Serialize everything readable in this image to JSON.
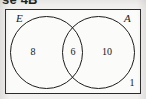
{
  "figure": {
    "header_clipped_text": "se 4B",
    "universal_set_label": "",
    "sets": [
      {
        "name": "E",
        "label": "E",
        "position": "left"
      },
      {
        "name": "A",
        "label": "A",
        "position": "right"
      }
    ],
    "regions": [
      {
        "name": "e-only",
        "label": "8",
        "description": "in E only"
      },
      {
        "name": "both",
        "label": "6",
        "description": "in E and A"
      },
      {
        "name": "a-only",
        "label": "10",
        "description": "in A only"
      },
      {
        "name": "outside",
        "label": "1",
        "description": "outside both sets"
      }
    ],
    "colors": {
      "stroke": "#1c1c1c",
      "rect_stroke": "#2b2b2b",
      "text": "#161616",
      "background": "#f2f1ef",
      "rect_fill": "#fbfbfa"
    }
  },
  "chart_data": {
    "type": "venn",
    "title": "",
    "set_labels": [
      "E",
      "A"
    ],
    "regions": {
      "E_only": 8,
      "intersection": 6,
      "A_only": 10,
      "outside": 1
    },
    "total": 25
  }
}
